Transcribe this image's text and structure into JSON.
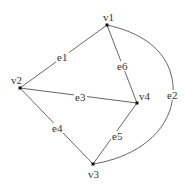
{
  "graph": {
    "vertices": [
      {
        "id": "v1",
        "label": "v1",
        "x": 107,
        "y": 25
      },
      {
        "id": "v2",
        "label": "v2",
        "x": 20,
        "y": 88
      },
      {
        "id": "v3",
        "label": "v3",
        "x": 93,
        "y": 164
      },
      {
        "id": "v4",
        "label": "v4",
        "x": 137,
        "y": 103
      }
    ],
    "edges": [
      {
        "id": "e1",
        "label": "e1",
        "from": "v1",
        "to": "v2"
      },
      {
        "id": "e2",
        "label": "e2",
        "from": "v1",
        "to": "v3",
        "curved": true
      },
      {
        "id": "e3",
        "label": "e3",
        "from": "v2",
        "to": "v4"
      },
      {
        "id": "e4",
        "label": "e4",
        "from": "v2",
        "to": "v3"
      },
      {
        "id": "e5",
        "label": "e5",
        "from": "v3",
        "to": "v4"
      },
      {
        "id": "e6",
        "label": "e6",
        "from": "v1",
        "to": "v4"
      }
    ]
  }
}
